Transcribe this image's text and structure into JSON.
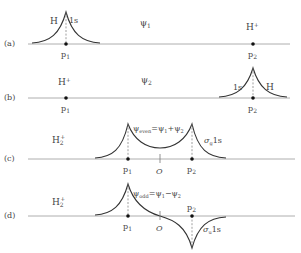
{
  "figure": {
    "panels": [
      {
        "id": "a",
        "row_label": "(a)",
        "psi_label": "ψ1",
        "left_atom_labels": [
          "H",
          "1s"
        ],
        "right_atom_label": "H⁺",
        "points": [
          "p1",
          "p2"
        ]
      },
      {
        "id": "b",
        "row_label": "(b)",
        "psi_label": "ψ2",
        "left_atom_label": "H⁺",
        "right_atom_labels": [
          "1s",
          "H"
        ],
        "points": [
          "p1",
          "p2"
        ]
      },
      {
        "id": "c",
        "row_label": "(c)",
        "molecule_label": "H₂⁺",
        "equation": "ψeven = ψ1 + ψ2",
        "orbital_label": "σg1s",
        "points": [
          "p1",
          "O",
          "p2"
        ]
      },
      {
        "id": "d",
        "row_label": "(d)",
        "molecule_label": "H₂⁺",
        "equation": "ψodd = ψ1 − ψ2",
        "orbital_label": "σu1s",
        "points": [
          "p1",
          "O",
          "p2"
        ]
      }
    ]
  },
  "labels": {
    "a_row": "(a)",
    "b_row": "(b)",
    "c_row": "(c)",
    "d_row": "(d)",
    "a_H": "H",
    "a_1s": "1s",
    "a_psi": "ψ",
    "a_psi_sub": "1",
    "a_Hplus": "H",
    "a_Hplus_sup": "+",
    "b_Hplus": "H",
    "b_Hplus_sup": "+",
    "b_psi": "ψ",
    "b_psi_sub": "2",
    "b_1s": "1s",
    "b_H": "H",
    "p": "p",
    "sub1": "1",
    "sub2": "2",
    "O": "O",
    "c_mol": "H",
    "c_mol_sub": "2",
    "c_mol_sup": "+",
    "c_eq_psi": "ψ",
    "c_eq_sub": "even",
    "c_eq_rest1": "=ψ",
    "c_eq_rest1_sub": "1",
    "c_eq_plus": "+ψ",
    "c_eq_rest2_sub": "2",
    "c_orb": "σ",
    "c_orb_sub": "g",
    "c_orb_rest": "1s",
    "d_mol": "H",
    "d_mol_sub": "2",
    "d_mol_sup": "+",
    "d_eq_psi": "ψ",
    "d_eq_sub": "odd",
    "d_eq_rest1": "=ψ",
    "d_eq_rest1_sub": "1",
    "d_eq_minus": "−ψ",
    "d_eq_rest2_sub": "2",
    "d_orb": "σ",
    "d_orb_sub": "u",
    "d_orb_rest": "1s"
  },
  "colors": {
    "axis": "#9a9a9a",
    "curve": "#333333",
    "text": "#444444"
  }
}
